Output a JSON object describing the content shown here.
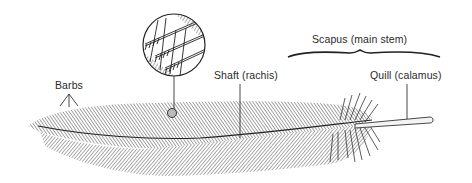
{
  "diagram": {
    "labels": {
      "barbs": "Barbs",
      "shaft": "Shaft (rachis)",
      "scapus": "Scapus (main stem)",
      "quill": "Quill (calamus)"
    },
    "inset": {
      "description": "Magnified view of barbs with barbules and hooklets"
    },
    "colors": {
      "ink": "#2a2a2a",
      "hatch": "#555555",
      "background": "#ffffff"
    }
  }
}
